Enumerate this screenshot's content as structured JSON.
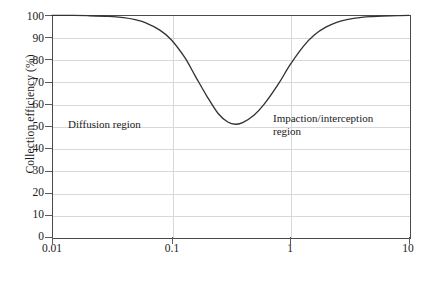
{
  "chart_data": {
    "type": "line",
    "title": "",
    "xlabel": "Particle diameter (µm)",
    "ylabel": "Collection efficiency (%)",
    "xscale": "log",
    "xlim": [
      0.01,
      10
    ],
    "ylim": [
      0,
      100
    ],
    "xticks": [
      0.01,
      0.1,
      1,
      10
    ],
    "xtick_labels": [
      "0.01",
      "0.1",
      "1",
      "10"
    ],
    "yticks": [
      0,
      10,
      20,
      30,
      40,
      50,
      60,
      70,
      80,
      90,
      100
    ],
    "ytick_labels": [
      "0",
      "10",
      "20",
      "30",
      "40",
      "50",
      "60",
      "70",
      "80",
      "90",
      "100"
    ],
    "grid": "horizontal-and-major-vertical",
    "legend": null,
    "line_color": "#333333",
    "grid_color": "#d8d8d8",
    "axis_color": "#4a4a4a",
    "background": "#ffffff",
    "series": [
      {
        "name": "Collection efficiency",
        "x": [
          0.01,
          0.015,
          0.02,
          0.03,
          0.04,
          0.05,
          0.06,
          0.08,
          0.1,
          0.13,
          0.16,
          0.2,
          0.25,
          0.3,
          0.35,
          0.4,
          0.5,
          0.6,
          0.8,
          1.0,
          1.3,
          1.6,
          2.0,
          2.5,
          3.0,
          4.0,
          5.0,
          6.0,
          8.0,
          10.0
        ],
        "y": [
          99.8,
          99.8,
          99.7,
          99.4,
          98.8,
          97.9,
          96.7,
          93.3,
          89.0,
          81.0,
          72.5,
          63.5,
          55.5,
          51.8,
          50.8,
          51.5,
          55.0,
          59.5,
          69.0,
          77.5,
          86.0,
          91.0,
          94.5,
          96.8,
          97.9,
          98.9,
          99.3,
          99.5,
          99.7,
          99.8
        ]
      }
    ],
    "annotations": [
      {
        "text": "Diffusion region",
        "x": 0.03,
        "y": 53,
        "lines": [
          "Diffusion region"
        ]
      },
      {
        "text": "Impaction/interception region",
        "x": 0.9,
        "y": 56,
        "lines": [
          "Impaction/interception",
          "region"
        ]
      }
    ],
    "minimum": {
      "x": 0.33,
      "y": 50.7
    }
  }
}
